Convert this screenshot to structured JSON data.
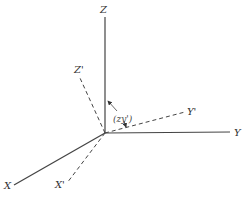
{
  "diagram": {
    "type": "coordinate-axes-rotation",
    "axes": {
      "original": [
        {
          "name": "X",
          "label": "X"
        },
        {
          "name": "Y",
          "label": "Y"
        },
        {
          "name": "Z",
          "label": "Z"
        }
      ],
      "rotated": [
        {
          "name": "X'",
          "label": "X'"
        },
        {
          "name": "Y'",
          "label": "Y'"
        },
        {
          "name": "Z'",
          "label": "Z'"
        }
      ]
    },
    "angle_label": "(zy')",
    "colors": {
      "line": "#333333",
      "background": "#ffffff"
    }
  }
}
